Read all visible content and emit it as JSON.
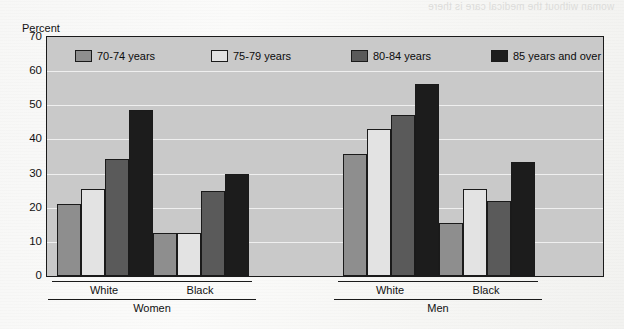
{
  "chart_data": {
    "type": "bar",
    "title": "",
    "xlabel": "",
    "ylabel": "Percent",
    "ylim": [
      0,
      70
    ],
    "yticks": [
      0,
      10,
      20,
      30,
      40,
      50,
      60,
      70
    ],
    "grid": true,
    "legend_position": "inside-top",
    "categories": [
      "White",
      "Black",
      "White",
      "Black"
    ],
    "group_labels": [
      "Women",
      "Men"
    ],
    "series": [
      {
        "name": "70-74 years",
        "color": "#8e8e8e",
        "values": [
          21.0,
          12.5,
          35.8,
          15.5
        ]
      },
      {
        "name": "75-79 years",
        "color": "#e3e3e3",
        "values": [
          25.6,
          12.5,
          43.0,
          25.6
        ]
      },
      {
        "name": "80-84 years",
        "color": "#5a5a5a",
        "values": [
          34.4,
          24.8,
          47.2,
          22.0
        ]
      },
      {
        "name": "85 years and over",
        "color": "#1c1c1c",
        "values": [
          48.5,
          29.9,
          56.2,
          33.5
        ]
      }
    ]
  },
  "axis": {
    "y_title": "Percent",
    "y_tick_labels": [
      "70",
      "60",
      "50",
      "40",
      "30",
      "20",
      "10",
      "0"
    ]
  },
  "legend": {
    "items": [
      {
        "label": "70-74 years",
        "color": "#8e8e8e"
      },
      {
        "label": "75-79 years",
        "color": "#e3e3e3"
      },
      {
        "label": "80-84 years",
        "color": "#5a5a5a"
      },
      {
        "label": "85 years and over",
        "color": "#1c1c1c"
      }
    ]
  },
  "x_axis": {
    "race_labels": [
      "White",
      "Black",
      "White",
      "Black"
    ],
    "sex_labels": [
      "Women",
      "Men"
    ]
  },
  "ghost_text": {
    "top": "woman without the medical care is there",
    "mid": "",
    "low": ""
  }
}
